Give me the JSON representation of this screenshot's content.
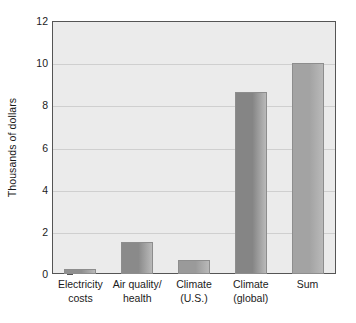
{
  "chart_data": {
    "type": "bar",
    "title": "",
    "subtitle": "",
    "xlabel": "",
    "ylabel": "Thousands of dollars",
    "ylim": [
      0,
      12
    ],
    "ytick_labels": [
      "12",
      "10",
      "8",
      "6",
      "4",
      "2",
      "0"
    ],
    "yticks": [
      12,
      10,
      8,
      6,
      4,
      2,
      0
    ],
    "grid": true,
    "legend": false,
    "categories": [
      "Electricity costs",
      "Air quality/ health",
      "Climate (U.S.)",
      "Climate (global)",
      "Sum"
    ],
    "category_lines": [
      [
        "Electricity",
        "costs"
      ],
      [
        "Air quality/",
        "health"
      ],
      [
        "Climate",
        "(U.S.)"
      ],
      [
        "Climate",
        "(global)"
      ],
      [
        "Sum",
        ""
      ]
    ],
    "values": [
      0.25,
      1.5,
      0.65,
      8.65,
      10.0
    ],
    "bar_colors": [
      "#8f8f8f",
      "#8a8a8a",
      "#9a9a9a",
      "#858585",
      "#a3a3a3"
    ],
    "plot_background": "#ebebeb",
    "axis_color": "#555555",
    "gridline_color": "#cfcfcf",
    "text_color": "#1b1b1b"
  }
}
